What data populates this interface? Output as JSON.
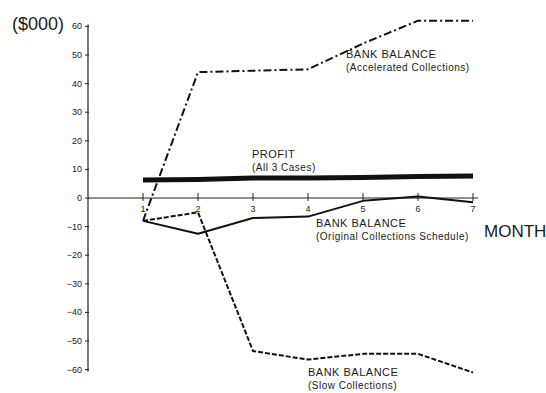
{
  "chart_data": {
    "type": "line",
    "title": "",
    "xlabel": "MONTH",
    "ylabel": "($000)",
    "x": [
      1,
      2,
      3,
      4,
      5,
      6,
      7
    ],
    "xticks": [
      "1",
      "2",
      "3",
      "4",
      "5",
      "6",
      "7"
    ],
    "yticks": [
      "60",
      "50",
      "40",
      "30",
      "20",
      "10",
      "0",
      "-10",
      "-20",
      "-30",
      "-40",
      "-50",
      "-60"
    ],
    "ylim": [
      -60,
      60
    ],
    "grid": false,
    "legend": "inline annotations",
    "series": [
      {
        "name": "Bank Balance (Accelerated Collections)",
        "style": "dash-dot",
        "values": [
          -8,
          44,
          44.5,
          45,
          54,
          62,
          62
        ]
      },
      {
        "name": "Profit (All 3 Cases)",
        "style": "thick-solid",
        "values": [
          6.3,
          6.5,
          7,
          7,
          7.2,
          7.5,
          7.7
        ]
      },
      {
        "name": "Bank Balance (Original Collections Schedule)",
        "style": "solid",
        "values": [
          -8,
          -12.5,
          -7,
          -6.5,
          -1,
          0.5,
          -1.5
        ]
      },
      {
        "name": "Bank Balance (Slow Collections)",
        "style": "dashed",
        "values": [
          -8,
          -5,
          -53.5,
          -56.5,
          -54.5,
          -54.5,
          -61
        ]
      }
    ],
    "annotations": [
      {
        "line1": "BANK  BALANCE",
        "line2": "(Accelerated  Collections)"
      },
      {
        "line1": "PROFIT",
        "line2": "(All  3  Cases)"
      },
      {
        "line1": "BANK  BALANCE",
        "line2": "(Original  Collections  Schedule)"
      },
      {
        "line1": "BANK  BALANCE",
        "line2": "(Slow  Collections)"
      }
    ]
  },
  "labels": {
    "unit": "($000)",
    "month": "MONTH"
  }
}
